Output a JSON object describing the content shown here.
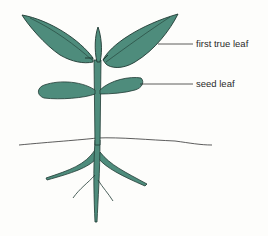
{
  "diagram": {
    "colors": {
      "plant": "#4e8c7c",
      "outline": "#1f3a33",
      "line": "#333333",
      "background": "#fdfdfb"
    },
    "labels": [
      {
        "id": "first-true-leaf",
        "text": "first true leaf"
      },
      {
        "id": "seed-leaf",
        "text": "seed leaf"
      }
    ]
  }
}
